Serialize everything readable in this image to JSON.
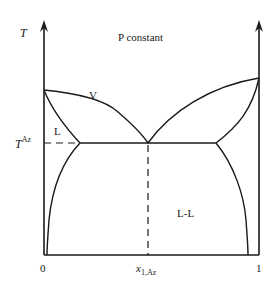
{
  "diagram": {
    "title": "P constant",
    "y_axis_label": "T",
    "azeotrope_temp_label": "T",
    "azeotrope_temp_superscript": "Az",
    "x_tick_left": "0",
    "x_tick_right": "1",
    "x_azeotrope_label_main": "x",
    "x_azeotrope_label_sub": "1,Az",
    "regions": {
      "vapor": "V",
      "liquid": "L",
      "liquid_liquid": "L-L"
    },
    "colors": {
      "line": "#1a1a1a",
      "background": "#ffffff"
    }
  }
}
